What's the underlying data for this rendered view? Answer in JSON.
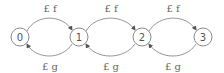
{
  "diagram": {
    "type": "state-transition-chain",
    "nodes": [
      {
        "id": "0",
        "label": "0",
        "x": 20,
        "y": 37
      },
      {
        "id": "1",
        "label": "1",
        "x": 79,
        "y": 37
      },
      {
        "id": "2",
        "label": "2",
        "x": 142,
        "y": 37
      },
      {
        "id": "3",
        "label": "3",
        "x": 203,
        "y": 37
      }
    ],
    "edges": [
      {
        "from": "0",
        "to": "1",
        "label": "£ f",
        "position": "top"
      },
      {
        "from": "1",
        "to": "0",
        "label": "£ g",
        "position": "bottom"
      },
      {
        "from": "1",
        "to": "2",
        "label": "£ f",
        "position": "top"
      },
      {
        "from": "2",
        "to": "1",
        "label": "£ g",
        "position": "bottom"
      },
      {
        "from": "2",
        "to": "3",
        "label": "£ f",
        "position": "top"
      },
      {
        "from": "3",
        "to": "2",
        "label": "£ g",
        "position": "bottom"
      }
    ],
    "colors": {
      "stroke": "#8a8a8a",
      "text": "#555555"
    }
  }
}
